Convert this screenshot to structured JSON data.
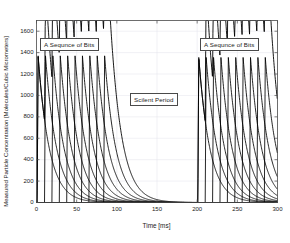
{
  "chart_data": {
    "type": "line",
    "title": "",
    "xlabel": "Time [ms]",
    "ylabel": "Measured Particle Concentration [Molecules/Cubic Micrometers]",
    "xlim": [
      0,
      300
    ],
    "ylim": [
      0,
      1700
    ],
    "xticks": [
      0,
      50,
      100,
      150,
      200,
      250,
      300
    ],
    "xtick_labels": [
      "0",
      "50",
      "100",
      "150",
      "200",
      "250",
      "300"
    ],
    "yticks": [
      0,
      200,
      400,
      600,
      800,
      1000,
      1200,
      1400,
      1600
    ],
    "ytick_labels": [
      "0",
      "200",
      "400",
      "600",
      "800",
      "1000",
      "1200",
      "1400",
      "1600"
    ],
    "grid": true,
    "legend": false,
    "line_color": "#000000",
    "peak_value": 1370,
    "baseline_value": 0,
    "pulse_width_ms": 1.2,
    "decay_tau_ms": 14,
    "burst_period_ms": 9.2,
    "series": [
      {
        "name": "Burst 1",
        "description": "A Sequnce of Bits",
        "pulse_start_times": [
          0.8,
          10.0,
          19.2,
          28.4,
          37.6,
          46.8,
          56.0,
          65.2,
          74.4,
          83.6
        ],
        "pulse_peaks": [
          1370,
          1370,
          1370,
          1370,
          1370,
          1370,
          1370,
          1370,
          1370,
          1370
        ]
      },
      {
        "name": "Silent Period",
        "description": "Scilent Period",
        "start_ms": 90,
        "end_ms": 200,
        "pulse_start_times": [],
        "pulse_peaks": []
      },
      {
        "name": "Burst 2",
        "description": "A Sequnce of Bits",
        "pulse_start_times": [
          200.8,
          210.0,
          219.2,
          228.4,
          237.6,
          246.8,
          256.0,
          265.2,
          274.4,
          283.6
        ],
        "pulse_peaks": [
          1355,
          1355,
          1355,
          1355,
          1355,
          1355,
          1355,
          1355,
          1355,
          1355
        ]
      }
    ]
  },
  "annotations": [
    {
      "id": "bits-left",
      "text": "A Sequnce of Bits"
    },
    {
      "id": "silent",
      "text": "Scilent Period"
    },
    {
      "id": "bits-right",
      "text": "A Sequnce of Bits"
    }
  ],
  "axes": {
    "xlabel": "Time [ms]",
    "ylabel": "Measured Particle Concentration [Molecules/Cubic Micrometers]"
  },
  "colors": {
    "line": "#000000",
    "axis": "#4a4a4a",
    "grid": "#e2e2ea",
    "background": "#ffffff",
    "text": "#1a1a1a"
  }
}
